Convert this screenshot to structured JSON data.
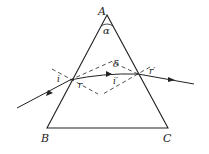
{
  "diagram": {
    "vertices": {
      "apex": "A",
      "bottom_left": "B",
      "bottom_right": "C"
    },
    "angles": {
      "apex_angle": "α",
      "incidence": "i",
      "refraction_first": "r",
      "incidence_second": "i′",
      "refraction_second": "r′",
      "deviation": "δ"
    }
  }
}
